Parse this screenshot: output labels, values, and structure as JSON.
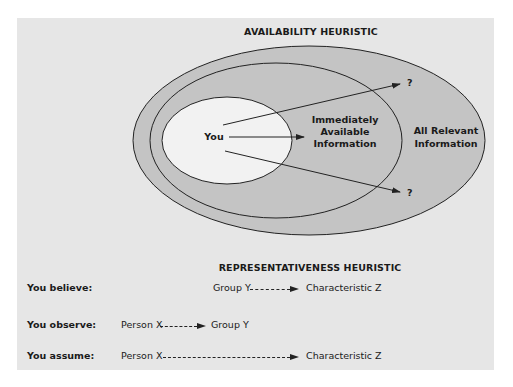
{
  "availability": {
    "title": "AVAILABILITY HEURISTIC",
    "you_label": "You",
    "inner_label": [
      "Immediately",
      "Available",
      "Information"
    ],
    "outer_label": [
      "All Relevant",
      "Information"
    ],
    "unknown_top": "?",
    "unknown_bottom": "?"
  },
  "representativeness": {
    "title": "REPRESENTATIVENESS HEURISTIC",
    "rows": [
      {
        "label": "You believe:",
        "from": "Group Y",
        "to": "Characteristic Z"
      },
      {
        "label": "You observe:",
        "from": "Person X",
        "to": "Group Y"
      },
      {
        "label": "You assume:",
        "from": "Person X",
        "to": "Characteristic Z"
      }
    ]
  },
  "colors": {
    "panel_bg": "#e6e6e6",
    "ellipse_fill": "#c4c4c4",
    "inner_fill": "#f2f2f2",
    "stroke": "#222222"
  }
}
